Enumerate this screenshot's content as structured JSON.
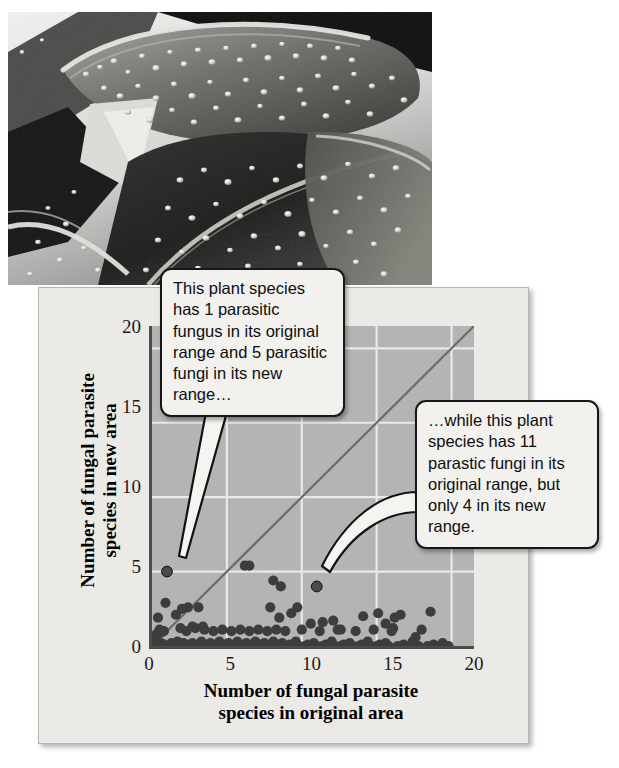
{
  "figure": {
    "photo_alt": "leaf-with-fungal-pustules-photograph"
  },
  "chart_data": {
    "type": "scatter",
    "title": "",
    "xlabel": "Number of fungal parasite species in original area",
    "ylabel": "Number of fungal parasite species in new area",
    "xlim": [
      0,
      21.5
    ],
    "ylim": [
      0,
      21.5
    ],
    "xticks": [
      0,
      5,
      10,
      15,
      20
    ],
    "yticks": [
      0,
      5,
      10,
      15,
      20
    ],
    "grid": true,
    "grid_color": "#e8e8e8",
    "plot_background": "#b4b4b4",
    "point_color": "#3d3d3d",
    "reference_line": {
      "label": "1:1 line",
      "from": [
        0,
        0
      ],
      "to": [
        21.5,
        21.5
      ],
      "color": "#6b6b6b"
    },
    "highlighted_points": [
      {
        "x": 1,
        "y": 5,
        "note": "1 parasitic fungus in original range, 5 in new range"
      },
      {
        "x": 11,
        "y": 4,
        "note": "11 parasitic fungi in original range, 4 in new range"
      }
    ],
    "points": [
      [
        0,
        0
      ],
      [
        0.2,
        0
      ],
      [
        0.3,
        0
      ],
      [
        0.4,
        0.1
      ],
      [
        0.5,
        0
      ],
      [
        0.6,
        0.2
      ],
      [
        0.7,
        0
      ],
      [
        0.8,
        0.1
      ],
      [
        0.9,
        0
      ],
      [
        0.2,
        0.4
      ],
      [
        0.3,
        0.8
      ],
      [
        0.5,
        1.1
      ],
      [
        0.4,
        1.9
      ],
      [
        0.6,
        0.9
      ],
      [
        0.8,
        1.0
      ],
      [
        1,
        5
      ],
      [
        0.9,
        2.9
      ],
      [
        1.2,
        0
      ],
      [
        1.3,
        0.2
      ],
      [
        1.4,
        0
      ],
      [
        1.5,
        0.1
      ],
      [
        1.6,
        0
      ],
      [
        1.7,
        0.3
      ],
      [
        1.8,
        0
      ],
      [
        1.9,
        0.1
      ],
      [
        2,
        0
      ],
      [
        2.1,
        0.2
      ],
      [
        2.2,
        0
      ],
      [
        2.3,
        1.0
      ],
      [
        2.4,
        0
      ],
      [
        2.5,
        0.1
      ],
      [
        2.6,
        0
      ],
      [
        2.7,
        0.2
      ],
      [
        2.8,
        0
      ],
      [
        2.9,
        1.2
      ],
      [
        3,
        0
      ],
      [
        3.1,
        0.1
      ],
      [
        3.2,
        0
      ],
      [
        3.3,
        0.3
      ],
      [
        3.4,
        0
      ],
      [
        3.5,
        1.1
      ],
      [
        3.6,
        0
      ],
      [
        3.7,
        0.1
      ],
      [
        3.8,
        0
      ],
      [
        3.9,
        0.2
      ],
      [
        4,
        0
      ],
      [
        4.1,
        1.0
      ],
      [
        4.2,
        0
      ],
      [
        4.3,
        0.1
      ],
      [
        4.4,
        0
      ],
      [
        4.5,
        0.3
      ],
      [
        4.6,
        0
      ],
      [
        4.7,
        1.1
      ],
      [
        4.8,
        0
      ],
      [
        4.9,
        0.1
      ],
      [
        2,
        2.5
      ],
      [
        2.4,
        2.6
      ],
      [
        3.1,
        2.6
      ],
      [
        1.6,
        2.1
      ],
      [
        1.9,
        1.2
      ],
      [
        2.7,
        1.3
      ],
      [
        3.4,
        1.3
      ],
      [
        5,
        0
      ],
      [
        5.1,
        0.2
      ],
      [
        5.2,
        0
      ],
      [
        5.3,
        1.0
      ],
      [
        5.4,
        0
      ],
      [
        5.5,
        0.1
      ],
      [
        5.6,
        0
      ],
      [
        5.7,
        0.3
      ],
      [
        5.8,
        0
      ],
      [
        5.9,
        1.1
      ],
      [
        6,
        0
      ],
      [
        6.1,
        0.1
      ],
      [
        6.2,
        0
      ],
      [
        6.3,
        0.2
      ],
      [
        6.4,
        0
      ],
      [
        6.5,
        1.0
      ],
      [
        6.6,
        0
      ],
      [
        6.7,
        0.1
      ],
      [
        6.8,
        0
      ],
      [
        6.9,
        0.3
      ],
      [
        7,
        0
      ],
      [
        7.1,
        1.1
      ],
      [
        7.2,
        0
      ],
      [
        7.3,
        0.1
      ],
      [
        7.4,
        0
      ],
      [
        7.5,
        0.2
      ],
      [
        7.6,
        0
      ],
      [
        7.7,
        1.0
      ],
      [
        7.8,
        0
      ],
      [
        7.9,
        0.1
      ],
      [
        8,
        0
      ],
      [
        8.1,
        0.3
      ],
      [
        8.2,
        0
      ],
      [
        8.3,
        1.1
      ],
      [
        8.4,
        0
      ],
      [
        8.5,
        0.1
      ],
      [
        8.6,
        0
      ],
      [
        8.7,
        0.2
      ],
      [
        8.8,
        0
      ],
      [
        8.9,
        1.0
      ],
      [
        6.2,
        5.4
      ],
      [
        6.5,
        5.4
      ],
      [
        8.1,
        4.4
      ],
      [
        8.6,
        4.0
      ],
      [
        7.9,
        2.6
      ],
      [
        8.5,
        1.9
      ],
      [
        9.3,
        2.2
      ],
      [
        9,
        0
      ],
      [
        9.2,
        0.1
      ],
      [
        9.4,
        0
      ],
      [
        9.6,
        0.3
      ],
      [
        9.8,
        0
      ],
      [
        10,
        1.1
      ],
      [
        10.2,
        0
      ],
      [
        10.4,
        0.1
      ],
      [
        10.6,
        0
      ],
      [
        10.8,
        0.2
      ],
      [
        11,
        0
      ],
      [
        11.2,
        1.0
      ],
      [
        11.4,
        0
      ],
      [
        11.6,
        0.1
      ],
      [
        11.8,
        0
      ],
      [
        12,
        0.3
      ],
      [
        12.2,
        0
      ],
      [
        12.4,
        1.1
      ],
      [
        12.6,
        0
      ],
      [
        12.8,
        0.1
      ],
      [
        13,
        0
      ],
      [
        13.2,
        0.2
      ],
      [
        11,
        4
      ],
      [
        9.7,
        2.6
      ],
      [
        10.6,
        1.5
      ],
      [
        11.4,
        1.6
      ],
      [
        12.1,
        1.7
      ],
      [
        12.6,
        1.1
      ],
      [
        13.4,
        0
      ],
      [
        13.6,
        1.0
      ],
      [
        13.8,
        0
      ],
      [
        14,
        0.1
      ],
      [
        14.2,
        0
      ],
      [
        14.4,
        0.3
      ],
      [
        14.6,
        0
      ],
      [
        14.8,
        1.1
      ],
      [
        15,
        0
      ],
      [
        15.2,
        0.1
      ],
      [
        15.4,
        0
      ],
      [
        15.6,
        0.2
      ],
      [
        15.8,
        0
      ],
      [
        16,
        1.0
      ],
      [
        14.1,
        2.0
      ],
      [
        15.1,
        2.2
      ],
      [
        15.6,
        1.5
      ],
      [
        16.2,
        1.9
      ],
      [
        16.6,
        2.1
      ],
      [
        16.1,
        1.2
      ],
      [
        16.4,
        0
      ],
      [
        16.8,
        0.1
      ],
      [
        17,
        0
      ],
      [
        17.4,
        0.3
      ],
      [
        17.8,
        0
      ],
      [
        18,
        1.1
      ],
      [
        18.4,
        0
      ],
      [
        18.8,
        0.1
      ],
      [
        19,
        0
      ],
      [
        19.4,
        0.2
      ],
      [
        18.6,
        2.3
      ],
      [
        17.6,
        0.6
      ],
      [
        19.8,
        0.0
      ]
    ]
  },
  "axis": {
    "y_ticks": [
      "20",
      "15",
      "10",
      "5",
      "0"
    ],
    "x_ticks": [
      "0",
      "5",
      "10",
      "15",
      "20"
    ],
    "x_title_line1": "Number of fungal parasite",
    "x_title_line2": "species in original area",
    "y_title_line1": "Number of fungal parasite",
    "y_title_line2": "species in new area"
  },
  "callouts": {
    "first": "This plant species has 1 parasitic fungus in its original range and 5 parasitic fungi in its new range…",
    "second": "…while this plant species has 11 parastic fungi in its original range, but only 4 in its new range."
  }
}
